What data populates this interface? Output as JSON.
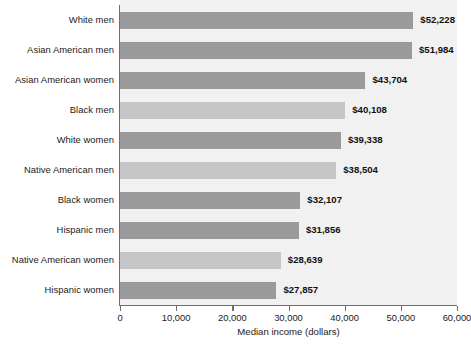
{
  "chart_data": {
    "type": "bar",
    "orientation": "horizontal",
    "title": "",
    "xlabel": "Median income (dollars)",
    "ylabel": "",
    "xlim": [
      0,
      60000
    ],
    "xticks": [
      0,
      10000,
      20000,
      30000,
      40000,
      50000,
      60000
    ],
    "xtick_labels": [
      "0",
      "10,000",
      "20,000",
      "30,000",
      "40,000",
      "50,000",
      "60,000"
    ],
    "grid": false,
    "legend": "none",
    "categories": [
      "White men",
      "Asian American men",
      "Asian American women",
      "Black men",
      "White women",
      "Native American men",
      "Black women",
      "Hispanic men",
      "Native American women",
      "Hispanic women"
    ],
    "values": [
      52228,
      51984,
      43704,
      40108,
      39338,
      38504,
      32107,
      31856,
      28639,
      27857
    ],
    "value_labels": [
      "$52,228",
      "$51,984",
      "$43,704",
      "$40,108",
      "$39,338",
      "$38,504",
      "$32,107",
      "$31,856",
      "$28,639",
      "$27,857"
    ],
    "bar_colors": [
      "#9a9a9a",
      "#9a9a9a",
      "#9a9a9a",
      "#c6c6c6",
      "#9a9a9a",
      "#c6c6c6",
      "#9a9a9a",
      "#9a9a9a",
      "#c6c6c6",
      "#9a9a9a"
    ],
    "plot_background": "#f1f1f1",
    "axis_color": "#6e6e6e"
  }
}
